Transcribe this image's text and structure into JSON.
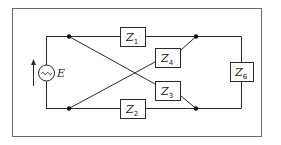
{
  "diagram": {
    "type": "circuit",
    "source": {
      "symbol": "~",
      "label": "E",
      "icon": "ac-voltage-source-icon"
    },
    "impedances": [
      {
        "id": "Z1",
        "letter": "Z",
        "sub": "1",
        "position": "top-branch"
      },
      {
        "id": "Z2",
        "letter": "Z",
        "sub": "2",
        "position": "bottom-branch"
      },
      {
        "id": "Z3",
        "letter": "Z",
        "sub": "3",
        "position": "cross-branch-lower"
      },
      {
        "id": "Z4",
        "letter": "Z",
        "sub": "4",
        "position": "cross-branch-upper"
      },
      {
        "id": "Z6",
        "letter": "Z",
        "sub": "6",
        "position": "load-branch"
      }
    ],
    "nodes": 4,
    "colors": {
      "wire": "#2a2a2a",
      "frame": "#6a6a6a",
      "background": "#ffffff"
    }
  }
}
